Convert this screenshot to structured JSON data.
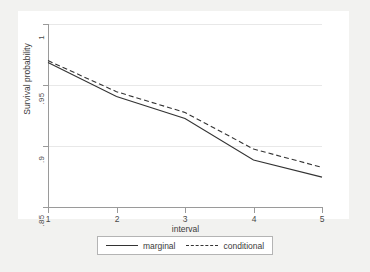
{
  "chart_data": {
    "type": "line",
    "title": "",
    "xlabel": "interval",
    "ylabel": "Survival probability",
    "xlim": [
      1,
      5
    ],
    "ylim": [
      0.85,
      1.0
    ],
    "xticks": [
      "1",
      "2",
      "3",
      "4",
      "5"
    ],
    "xtick_values": [
      1,
      2,
      3,
      4,
      5
    ],
    "yticks": [
      "1",
      ".95",
      ".9",
      ".85"
    ],
    "ytick_values": [
      1,
      0.95,
      0.9,
      0.85
    ],
    "grid": true,
    "grid_axis": "y",
    "legend_position": "below",
    "x": [
      1,
      2,
      3,
      4,
      5
    ],
    "series": [
      {
        "name": "marginal",
        "style": "solid",
        "color": "#333333",
        "values": [
          0.9685,
          0.9405,
          0.9225,
          0.8885,
          0.8745
        ]
      },
      {
        "name": "conditional",
        "style": "dashed",
        "color": "#333333",
        "values": [
          0.97,
          0.9445,
          0.9275,
          0.8975,
          0.8825
        ]
      }
    ]
  },
  "axes": {
    "y_title": "Survival probability",
    "x_title": "interval",
    "y_tick_labels": [
      "1",
      ".95",
      ".9",
      ".85"
    ],
    "x_tick_labels": [
      "1",
      "2",
      "3",
      "4",
      "5"
    ]
  },
  "legend": {
    "items": [
      {
        "label": "marginal",
        "style": "solid"
      },
      {
        "label": "conditional",
        "style": "dashed"
      }
    ]
  },
  "colors": {
    "figure_background": "#f2f2f0",
    "plot_background": "#ffffff",
    "axis": "#9a9a9a",
    "grid": "#e8e8e8",
    "line": "#333333",
    "text": "#3a3a3a"
  }
}
